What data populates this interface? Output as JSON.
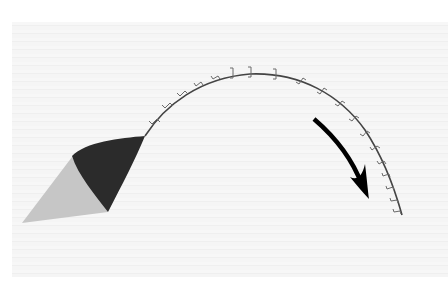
{
  "diagram": {
    "colors": {
      "background": "#ffffff",
      "paper": "#f4f4f4",
      "flap_dark": "#2b2b2b",
      "flap_shadow": "#c6c6c6",
      "incision_line": "#444444",
      "staples": "#6a6a6a",
      "arrow": "#000000"
    },
    "elements": [
      {
        "name": "skin-flap",
        "description": "dark curved flap at start of incision"
      },
      {
        "name": "flap-shadow",
        "description": "light gray triangular shadow under flap"
      },
      {
        "name": "incision-line",
        "description": "arched suture line with staple marks"
      },
      {
        "name": "direction-arrow",
        "description": "bold curved arrow pointing downward along arc"
      }
    ],
    "staple_count": 19
  }
}
